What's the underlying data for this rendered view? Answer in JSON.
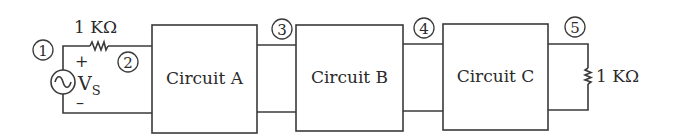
{
  "diagram": {
    "type": "circuit-block-diagram",
    "source": {
      "label": "V",
      "subscript": "S",
      "icon": "ac-voltage-source-icon",
      "plus": "+",
      "minus": "–"
    },
    "series_resistor": {
      "label": "1 KΩ"
    },
    "load_resistor": {
      "label": "1 KΩ"
    },
    "blocks": [
      {
        "label": "Circuit A"
      },
      {
        "label": "Circuit B"
      },
      {
        "label": "Circuit C"
      }
    ],
    "nodes": [
      {
        "label": "1"
      },
      {
        "label": "2"
      },
      {
        "label": "3"
      },
      {
        "label": "4"
      },
      {
        "label": "5"
      }
    ],
    "colors": {
      "line": "#3a3a3a",
      "text": "#2a2a2a",
      "background": "#ffffff"
    }
  }
}
